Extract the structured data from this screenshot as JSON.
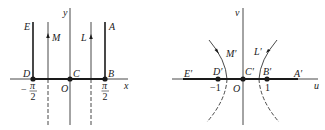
{
  "left_diagram": {
    "axes": {
      "x": "x",
      "y": "y",
      "origin": "O"
    },
    "points": {
      "E": "E",
      "D": "D",
      "C": "C",
      "B": "B",
      "A": "A",
      "M": "M",
      "L": "L"
    },
    "ticks": {
      "neg_half_pi_sign": "−",
      "pi_num": "π",
      "two_den": "2"
    }
  },
  "right_diagram": {
    "axes": {
      "u": "u",
      "v": "v",
      "origin": "O"
    },
    "points": {
      "E": "E′",
      "D": "D′",
      "C": "C′",
      "B": "B′",
      "A": "A′",
      "M": "M′",
      "L": "L′"
    },
    "ticks": {
      "neg_one": "−1",
      "one": "1"
    }
  },
  "colors": {
    "stroke": "#1a1a1a",
    "background": "#ffffff"
  }
}
